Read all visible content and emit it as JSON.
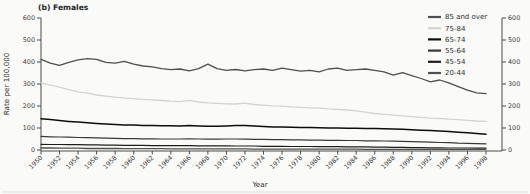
{
  "title": "(b) Females",
  "colors": {
    "axis": "#4a4a4a",
    "text": "#2e2e2e",
    "tick_text": "#3c3c3c",
    "bottom_rule": "#dcdcda",
    "background": "#fafaf8"
  },
  "chart_data": {
    "type": "line",
    "title": "(b) Females",
    "xlabel": "Year",
    "ylabel": "Rate per 100,000",
    "ylim": [
      0,
      600
    ],
    "y_ticks": [
      0,
      100,
      200,
      300,
      400,
      500,
      600
    ],
    "dual_y_axis": true,
    "grid": false,
    "legend_position": "top-right",
    "x_tick_step": 2,
    "x": [
      1950,
      1951,
      1952,
      1953,
      1954,
      1955,
      1956,
      1957,
      1958,
      1959,
      1960,
      1961,
      1962,
      1963,
      1964,
      1965,
      1966,
      1967,
      1968,
      1969,
      1970,
      1971,
      1972,
      1973,
      1974,
      1975,
      1976,
      1977,
      1978,
      1979,
      1980,
      1981,
      1982,
      1983,
      1984,
      1985,
      1986,
      1987,
      1988,
      1989,
      1990,
      1991,
      1992,
      1993,
      1994,
      1995,
      1996,
      1997,
      1998
    ],
    "series": [
      {
        "name": "85 and over",
        "color": "#4f4f4f",
        "width": 1.3,
        "values": [
          412,
          395,
          385,
          398,
          410,
          415,
          412,
          398,
          395,
          403,
          390,
          382,
          378,
          370,
          365,
          368,
          360,
          370,
          390,
          370,
          362,
          366,
          360,
          365,
          368,
          362,
          372,
          365,
          358,
          362,
          355,
          368,
          372,
          362,
          365,
          368,
          362,
          355,
          340,
          352,
          338,
          325,
          310,
          318,
          305,
          288,
          272,
          260,
          256
        ]
      },
      {
        "name": "75-84",
        "color": "#d3d3d0",
        "width": 1.3,
        "values": [
          305,
          295,
          286,
          274,
          264,
          258,
          250,
          245,
          240,
          236,
          233,
          230,
          228,
          225,
          222,
          220,
          226,
          218,
          214,
          212,
          210,
          209,
          213,
          207,
          204,
          201,
          199,
          196,
          194,
          192,
          190,
          187,
          185,
          182,
          178,
          172,
          166,
          162,
          158,
          155,
          152,
          148,
          145,
          143,
          140,
          138,
          135,
          132,
          130
        ]
      },
      {
        "name": "65-74",
        "color": "#0d0d0d",
        "width": 1.5,
        "values": [
          142,
          138,
          134,
          130,
          127,
          124,
          121,
          118,
          116,
          114,
          113,
          112,
          111,
          110,
          110,
          109,
          111,
          109,
          108,
          108,
          109,
          111,
          112,
          109,
          107,
          105,
          104,
          103,
          102,
          102,
          101,
          100,
          100,
          99,
          99,
          98,
          98,
          97,
          96,
          94,
          92,
          90,
          88,
          86,
          84,
          81,
          78,
          75,
          72
        ]
      },
      {
        "name": "55-64",
        "color": "#383838",
        "width": 1.2,
        "values": [
          62,
          60,
          59,
          58,
          57,
          56,
          55,
          54,
          53,
          52,
          52,
          51,
          51,
          50,
          50,
          50,
          51,
          50,
          49,
          49,
          50,
          50,
          49,
          48,
          48,
          47,
          47,
          46,
          46,
          45,
          45,
          44,
          44,
          43,
          43,
          42,
          42,
          41,
          40,
          39,
          38,
          37,
          36,
          34,
          33,
          31,
          30,
          29,
          28
        ]
      },
      {
        "name": "45-54",
        "color": "#1c1c1c",
        "width": 1.2,
        "values": [
          26,
          25,
          25,
          24,
          24,
          23,
          23,
          22,
          22,
          21,
          21,
          21,
          20,
          20,
          20,
          20,
          20,
          19,
          19,
          19,
          19,
          18,
          18,
          18,
          17,
          17,
          17,
          16,
          16,
          16,
          15,
          15,
          15,
          14,
          14,
          14,
          13,
          13,
          12,
          12,
          11,
          11,
          10,
          10,
          9,
          9,
          9,
          8,
          8
        ]
      },
      {
        "name": "20-44",
        "color": "#4f4f4f",
        "width": 1.3,
        "values": [
          9,
          9,
          8,
          8,
          8,
          7,
          7,
          7,
          7,
          6,
          6,
          6,
          6,
          6,
          5,
          5,
          5,
          5,
          5,
          5,
          5,
          5,
          5,
          4,
          4,
          4,
          4,
          4,
          4,
          4,
          4,
          4,
          4,
          4,
          4,
          3,
          3,
          3,
          3,
          3,
          3,
          3,
          3,
          3,
          3,
          3,
          3,
          3,
          3
        ]
      }
    ]
  }
}
